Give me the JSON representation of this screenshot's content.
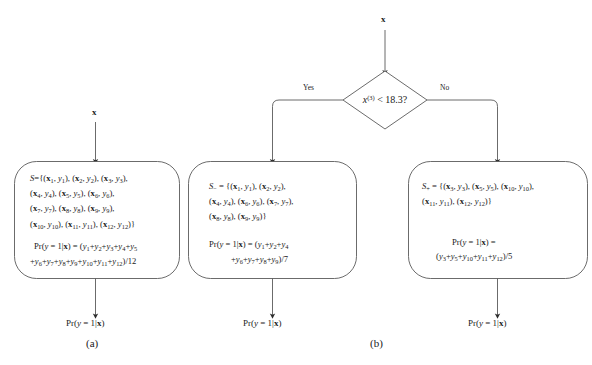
{
  "figure": {
    "background": "#ffffff",
    "stroke": "#4a4a4a",
    "text_color": "#1a1a1a"
  },
  "panel_a": {
    "input_label": "x",
    "panel_label": "(a)",
    "output_label_pre": "Pr(",
    "output_label": "Pr(y = 1|x)",
    "set_name": "S",
    "set_lines": [
      "S={(x1, y1), (x2, y2), (x3, y3),",
      "(x4, y4), (x5, y5), (x6, y6),",
      "(x7, y7), (x8, y8), (x9, y9),",
      "(x10, y10), (x11, y11), (x12, y12)}"
    ],
    "formula_lines": [
      "Pr(y = 1|x) = (y1+y2+y3+y4+y5",
      "+y6+y7+y8+y9+y10+y11+y12)/12"
    ],
    "denominator": "12",
    "pairs": [
      [
        1,
        1
      ],
      [
        2,
        2
      ],
      [
        3,
        3
      ],
      [
        4,
        4
      ],
      [
        5,
        5
      ],
      [
        6,
        6
      ],
      [
        7,
        7
      ],
      [
        8,
        8
      ],
      [
        9,
        9
      ],
      [
        10,
        10
      ],
      [
        11,
        11
      ],
      [
        12,
        12
      ]
    ]
  },
  "panel_b": {
    "input_label": "x",
    "panel_label": "(b)",
    "decision": {
      "feature": "x",
      "superscript": "(3)",
      "operator": "<",
      "threshold": "18.3",
      "question_mark": "?",
      "text": "x(3) < 18.3?"
    },
    "yes_label": "Yes",
    "no_label": "No",
    "left_box": {
      "set_name": "S−",
      "set_lines": [
        "S− = {(x1, y1), (x2, y2),",
        "(x4, y4), (x6, y6), (x7, y7),",
        "(x8, y8), (x9, y9)}"
      ],
      "formula_lines": [
        "Pr(y = 1|x) = (y1+y2+y4",
        "+y6+y7+y8+y9)/7"
      ],
      "denominator": "7",
      "pairs": [
        [
          1,
          1
        ],
        [
          2,
          2
        ],
        [
          4,
          4
        ],
        [
          6,
          6
        ],
        [
          7,
          7
        ],
        [
          8,
          8
        ],
        [
          9,
          9
        ]
      ],
      "output_label": "Pr(y = 1|x)"
    },
    "right_box": {
      "set_name": "S+",
      "set_lines": [
        "S+ = {(x3, y3), (x5, y5), (x10, y10),",
        "(x11, y11), (x12, y12)}"
      ],
      "formula_lines": [
        "Pr(y = 1|x) =",
        "(y3+y5+y10+y11+y12)/5"
      ],
      "denominator": "5",
      "pairs": [
        [
          3,
          3
        ],
        [
          5,
          5
        ],
        [
          10,
          10
        ],
        [
          11,
          11
        ],
        [
          12,
          12
        ]
      ],
      "output_label": "Pr(y = 1|x)"
    }
  },
  "caption": {
    "text": ""
  }
}
